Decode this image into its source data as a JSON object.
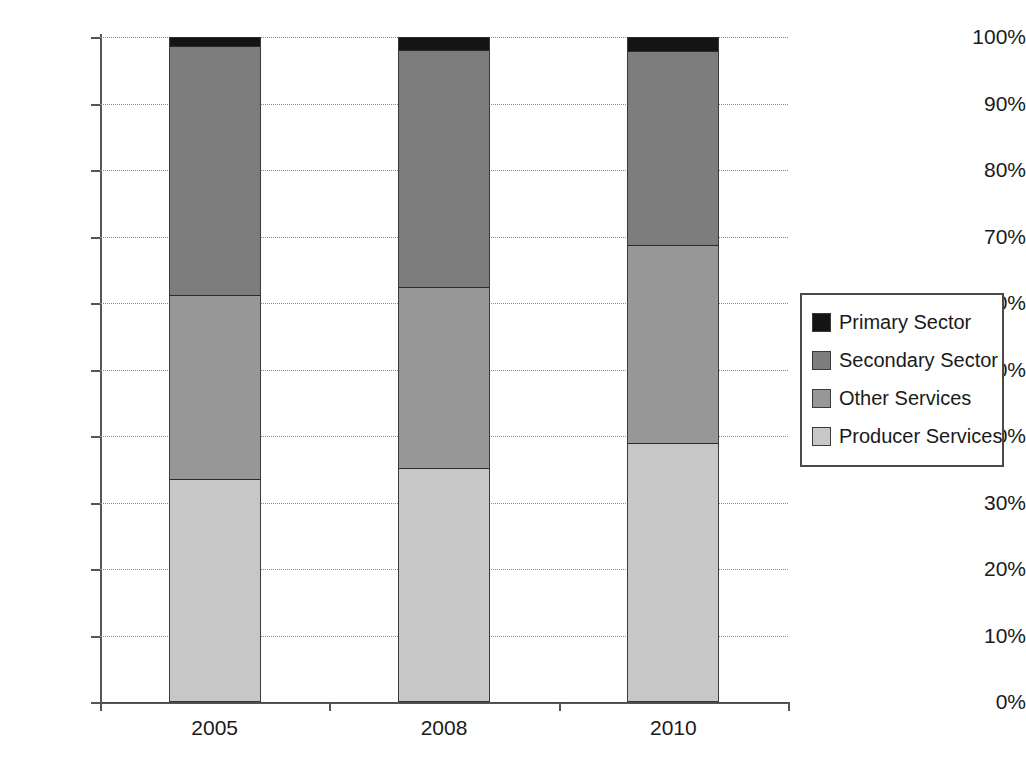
{
  "chart_data": {
    "type": "bar",
    "stacked": true,
    "normalized_percent": true,
    "title": "",
    "xlabel": "",
    "ylabel": "",
    "categories": [
      "2005",
      "2008",
      "2010"
    ],
    "ylim": [
      0,
      100
    ],
    "ytick_labels": [
      "0%",
      "10%",
      "20%",
      "30%",
      "40%",
      "50%",
      "60%",
      "70%",
      "80%",
      "90%",
      "100%"
    ],
    "ytick_values": [
      0,
      10,
      20,
      30,
      40,
      50,
      60,
      70,
      80,
      90,
      100
    ],
    "grid": true,
    "legend_position": "right",
    "series": [
      {
        "name": "Producer Services",
        "color": "#c7c7c7",
        "values": [
          33.5,
          35.2,
          38.9
        ]
      },
      {
        "name": "Other Services",
        "color": "#979797",
        "values": [
          27.7,
          27.2,
          29.8
        ]
      },
      {
        "name": "Secondary Sector",
        "color": "#7d7d7d",
        "values": [
          37.4,
          35.6,
          29.2
        ]
      },
      {
        "name": "Primary Sector",
        "color": "#141414",
        "values": [
          1.4,
          2.0,
          2.1
        ]
      }
    ]
  },
  "legend": {
    "items": [
      {
        "label": "Primary Sector",
        "color": "#141414"
      },
      {
        "label": "Secondary Sector",
        "color": "#7d7d7d"
      },
      {
        "label": "Other Services",
        "color": "#979797"
      },
      {
        "label": "Producer Services",
        "color": "#c7c7c7"
      }
    ]
  }
}
